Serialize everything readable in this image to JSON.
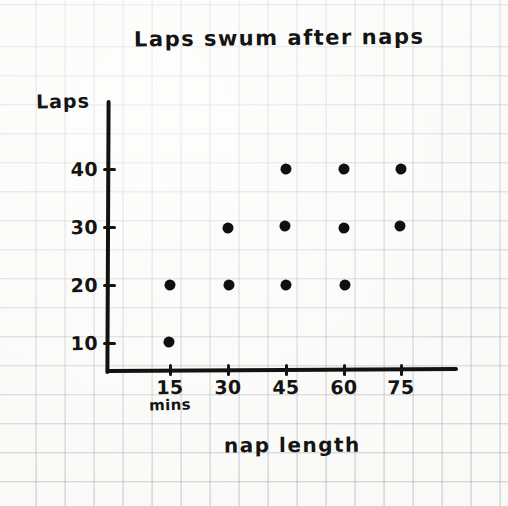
{
  "chart_data": {
    "type": "scatter",
    "title": "Laps swum after naps",
    "xlabel": "nap length",
    "x_unit": "mins",
    "ylabel": "Laps",
    "x_ticks": [
      15,
      30,
      45,
      60,
      75
    ],
    "x_tick_labels": [
      "15",
      "30",
      "45",
      "60",
      "75"
    ],
    "y_ticks": [
      10,
      20,
      30,
      40
    ],
    "y_tick_labels": [
      "10",
      "20",
      "30",
      "40"
    ],
    "xlim": [
      0,
      90
    ],
    "ylim": [
      0,
      50
    ],
    "grid": true,
    "grid_style": "graph-paper",
    "legend": null,
    "marker": "filled-dot",
    "ink_color": "#141414",
    "paper_color": "#fdfdfb",
    "grid_color": "#3c3c4b",
    "points": [
      {
        "x": 15,
        "y": 10
      },
      {
        "x": 15,
        "y": 20
      },
      {
        "x": 30,
        "y": 20
      },
      {
        "x": 30,
        "y": 30
      },
      {
        "x": 45,
        "y": 20
      },
      {
        "x": 45,
        "y": 30
      },
      {
        "x": 45,
        "y": 40
      },
      {
        "x": 60,
        "y": 20
      },
      {
        "x": 60,
        "y": 30
      },
      {
        "x": 60,
        "y": 40
      },
      {
        "x": 75,
        "y": 30
      },
      {
        "x": 75,
        "y": 40
      }
    ]
  },
  "geometry": {
    "x_axis_y_px": 370,
    "y_axis_x_px": 108,
    "x_tick_px": [
      170,
      228,
      286,
      344,
      401
    ],
    "y_tick_px": [
      343,
      285,
      227,
      169
    ],
    "x_tick_label_y_px": 376,
    "x_unit_label_y_px": 396,
    "y_tick_label_x_px": 98
  }
}
